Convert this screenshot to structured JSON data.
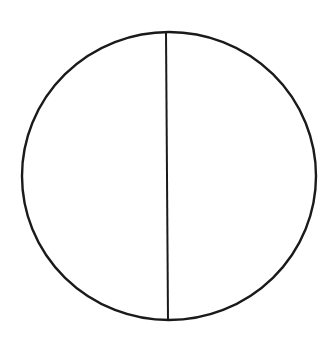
{
  "diagram": {
    "background": "#ffffff",
    "stroke_color": "#1a1a1a",
    "circle": {
      "cx": 169,
      "cy": 176,
      "rx": 147,
      "ry": 144,
      "stroke_width": 2.4
    },
    "divider": {
      "x1": 166,
      "y1": 32,
      "x2": 168,
      "y2": 320,
      "stroke_width": 2
    },
    "regions": [
      {
        "name": "left-half"
      },
      {
        "name": "right-half"
      }
    ]
  }
}
